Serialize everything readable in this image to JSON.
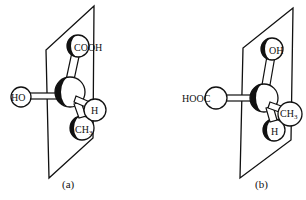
{
  "figure": {
    "type": "stereochemistry ball-and-stick models of lactic acid enantiomers in a mirror plane",
    "panels": [
      {
        "id": "a",
        "caption": "(a)",
        "atoms": {
          "top": "COOH",
          "left": "HO",
          "front_right": "H",
          "bottom": "CH",
          "bottom_sub": "3"
        }
      },
      {
        "id": "b",
        "caption": "(b)",
        "atoms": {
          "top": "OH",
          "left": "HOOC",
          "front_right": "CH",
          "front_right_sub": "3",
          "bottom": "H"
        }
      }
    ]
  },
  "colors": {
    "ink": "#111111",
    "background": "#ffffff"
  }
}
